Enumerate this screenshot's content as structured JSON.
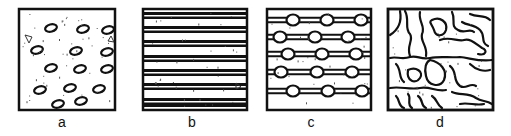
{
  "figure": {
    "panels": [
      {
        "id": "a",
        "label": "a",
        "pattern": "isolated-elliptical-inclusions",
        "inclusion_count": 14
      },
      {
        "id": "b",
        "label": "b",
        "pattern": "parallel-lamellar-bands",
        "band_count": 7
      },
      {
        "id": "c",
        "label": "c",
        "pattern": "beaded-chain-lines",
        "chain_count": 5,
        "beads_per_chain": 3
      },
      {
        "id": "d",
        "label": "d",
        "pattern": "interconnected-network"
      }
    ],
    "colors": {
      "ink": "#111111",
      "background": "#ffffff"
    }
  }
}
